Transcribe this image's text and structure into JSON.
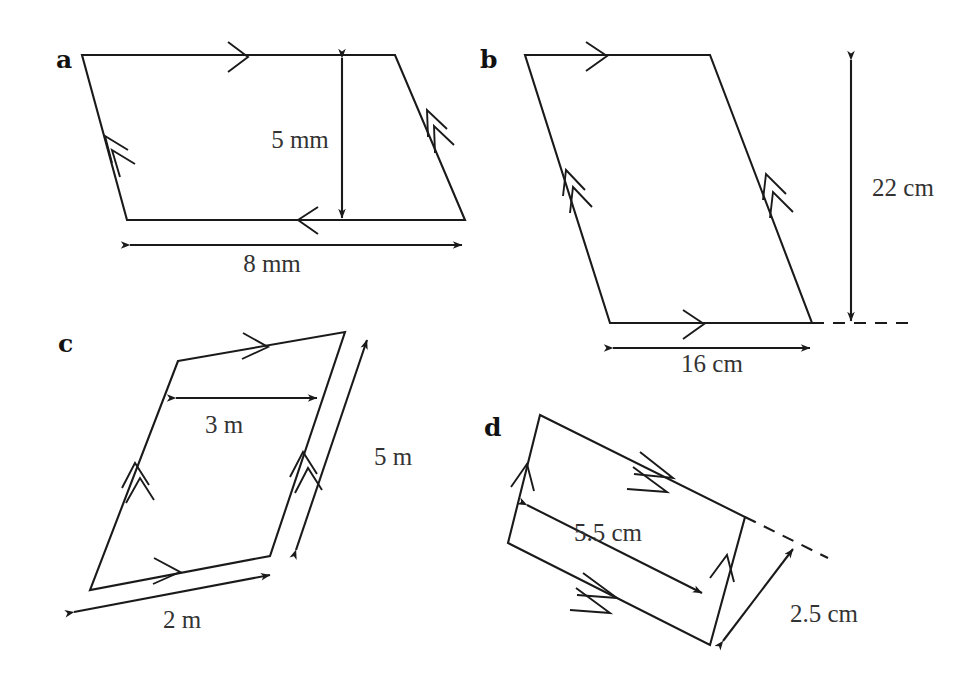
{
  "figure": {
    "kind": "geometry-diagram",
    "background_color": "#ffffff",
    "line_color": "#1a1a1a",
    "text_color": "#333333",
    "panels": [
      {
        "id": "a",
        "label": "a",
        "label_x": 56,
        "label_y": 68,
        "vertices": [
          [
            82,
            55
          ],
          [
            395,
            55
          ],
          [
            465,
            220
          ],
          [
            127,
            220
          ]
        ],
        "tick_single_edges": [
          "top",
          "bottom"
        ],
        "tick_double_edges": [
          "left",
          "right"
        ],
        "dimensions": [
          {
            "name": "height",
            "value": "5 mm",
            "orientation": "vertical",
            "label_x": 300,
            "label_y": 148
          },
          {
            "name": "base",
            "value": "8 mm",
            "orientation": "horizontal",
            "label_x": 272,
            "label_y": 272
          }
        ]
      },
      {
        "id": "b",
        "label": "b",
        "label_x": 480,
        "label_y": 68,
        "vertices": [
          [
            525,
            55
          ],
          [
            710,
            55
          ],
          [
            812,
            323
          ],
          [
            610,
            323
          ]
        ],
        "tick_single_edges": [
          "top",
          "bottom"
        ],
        "tick_double_edges": [
          "left",
          "right"
        ],
        "has_dashed_extension": true,
        "dimensions": [
          {
            "name": "height",
            "value": "22 cm",
            "orientation": "vertical",
            "label_x": 903,
            "label_y": 196
          },
          {
            "name": "base",
            "value": "16 cm",
            "orientation": "horizontal",
            "label_x": 712,
            "label_y": 372
          }
        ]
      },
      {
        "id": "c",
        "label": "c",
        "label_x": 58,
        "label_y": 352,
        "vertices": [
          [
            178,
            361
          ],
          [
            345,
            332
          ],
          [
            270,
            556
          ],
          [
            90,
            590
          ]
        ],
        "tick_single_edges": [
          "top",
          "bottom"
        ],
        "tick_double_edges": [
          "left",
          "right"
        ],
        "dimensions": [
          {
            "name": "height",
            "value": "3 m",
            "orientation": "horizontal",
            "label_x": 224,
            "label_y": 433
          },
          {
            "name": "side",
            "value": "5 m",
            "orientation": "oblique",
            "label_x": 374,
            "label_y": 465
          },
          {
            "name": "base",
            "value": "2 m",
            "orientation": "oblique",
            "label_x": 182,
            "label_y": 625
          }
        ]
      },
      {
        "id": "d",
        "label": "d",
        "label_x": 484,
        "label_y": 436,
        "vertices": [
          [
            540,
            415
          ],
          [
            745,
            517
          ],
          [
            710,
            645
          ],
          [
            508,
            543
          ]
        ],
        "tick_single_edges": [
          "left",
          "right"
        ],
        "tick_double_edges": [
          "top",
          "bottom"
        ],
        "has_dashed_extension": true,
        "dimensions": [
          {
            "name": "base",
            "value": "5.5 cm",
            "orientation": "oblique",
            "label_x": 587,
            "label_y": 535
          },
          {
            "name": "height",
            "value": "2.5 cm",
            "orientation": "oblique",
            "label_x": 778,
            "label_y": 622
          }
        ]
      }
    ]
  }
}
